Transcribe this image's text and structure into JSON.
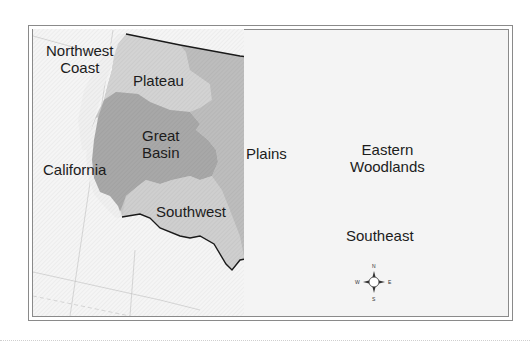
{
  "map": {
    "type": "region-map",
    "subject": "Native American culture areas of the contiguous United States",
    "regions": [
      {
        "id": "northwest-coast",
        "label_line1": "Northwest",
        "label_line2": "Coast",
        "fill": "#f2f2f2"
      },
      {
        "id": "plateau",
        "label": "Plateau",
        "fill": "#d2d2d2"
      },
      {
        "id": "great-basin",
        "label_line1": "Great",
        "label_line2": "Basin",
        "fill": "#a9a9a9"
      },
      {
        "id": "california",
        "label": "California",
        "fill": "#f2f2f2"
      },
      {
        "id": "plains",
        "label": "Plains",
        "fill": "#bdbdbd"
      },
      {
        "id": "eastern-woodlands",
        "label_line1": "Eastern",
        "label_line2": "Woodlands",
        "fill": "#a9a9a9"
      },
      {
        "id": "southwest",
        "label": "Southwest",
        "fill": "#cdcdcd"
      },
      {
        "id": "southeast",
        "label": "Southeast",
        "fill": "#d6d6d6"
      }
    ],
    "compass": {
      "n": "N",
      "s": "S",
      "e": "E",
      "w": "W"
    },
    "colors": {
      "background": "#ffffff",
      "ocean": "#f4f4f4",
      "border": "#1a1a1a",
      "frame": "#7a7a7a",
      "graticule": "#c8c8c8"
    }
  }
}
